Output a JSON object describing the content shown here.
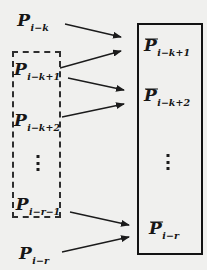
{
  "colors": {
    "background": "#f0f0ee",
    "ink": "#161616"
  },
  "left_column": {
    "top": {
      "base": "P",
      "sub": "i−k"
    },
    "dashed_group": {
      "first": {
        "base": "P",
        "sub": "i−k+1"
      },
      "second": {
        "base": "P",
        "sub": "i−k+2"
      },
      "ellipsis": "⋮",
      "last": {
        "base": "P",
        "sub": "i−r−1"
      }
    },
    "bottom": {
      "base": "P",
      "sub": "i−r"
    }
  },
  "right_column": {
    "box": {
      "first": {
        "base": "P",
        "sub": "i−k+1",
        "overline": true
      },
      "second": {
        "base": "P",
        "sub": "i−k+2",
        "overline": true
      },
      "ellipsis": "⋮",
      "last": {
        "base": "P",
        "sub": "i−r",
        "overline": true
      }
    }
  },
  "arrows": [
    {
      "from": "P_(i−k)",
      "to": "P̄_(i−k+1)"
    },
    {
      "from": "P_(i−k+1)",
      "to": "P̄_(i−k+1)"
    },
    {
      "from": "P_(i−k+1)",
      "to": "P̄_(i−k+2)"
    },
    {
      "from": "P_(i−k+2)",
      "to": "P̄_(i−k+2)"
    },
    {
      "from": "P_(i−r−1)",
      "to": "P̄_(i−r)"
    },
    {
      "from": "P_(i−r)",
      "to": "P̄_(i−r)"
    }
  ]
}
